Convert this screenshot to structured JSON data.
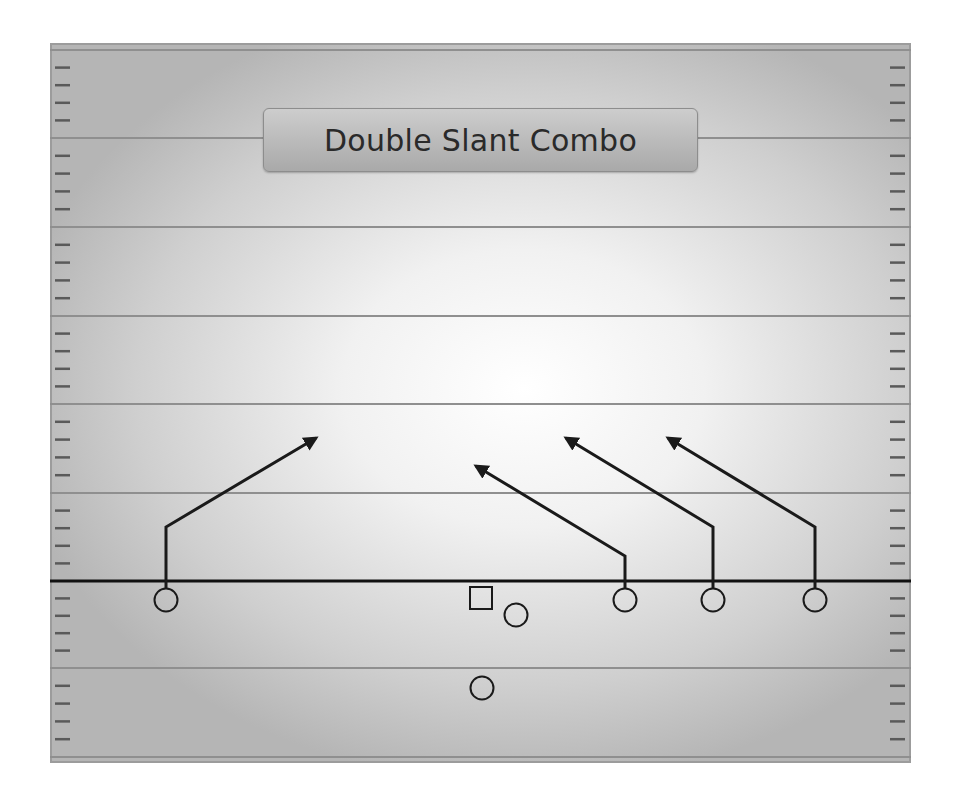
{
  "title": "Double Slant Combo",
  "colors": {
    "field_edge": "#b5b5b5",
    "field_center": "#ffffff",
    "yard_line": "#8f8f8f",
    "hash_mark": "#5a5a5a",
    "line_of_scrimmage": "#111111",
    "route": "#1a1a1a",
    "player_stroke": "#1a1a1a"
  },
  "field": {
    "x": 50,
    "y": 43,
    "width": 861,
    "height": 720,
    "yard_lines_y": [
      50,
      138,
      227,
      316,
      404,
      493,
      668,
      757
    ],
    "line_of_scrimmage_y": 581,
    "hash_spacing": 17.7
  },
  "players": [
    {
      "id": "wr-left",
      "shape": "circle",
      "x": 166,
      "y": 600
    },
    {
      "id": "center",
      "shape": "square",
      "x": 481,
      "y": 598
    },
    {
      "id": "qb",
      "shape": "circle",
      "x": 516,
      "y": 615
    },
    {
      "id": "slot-1",
      "shape": "circle",
      "x": 625,
      "y": 600
    },
    {
      "id": "slot-2",
      "shape": "circle",
      "x": 713,
      "y": 600
    },
    {
      "id": "wr-right",
      "shape": "circle",
      "x": 815,
      "y": 600
    },
    {
      "id": "running-back",
      "shape": "circle",
      "x": 482,
      "y": 688
    }
  ],
  "routes": [
    {
      "player": "wr-left",
      "type": "slant",
      "points": [
        [
          166,
          588
        ],
        [
          166,
          527
        ],
        [
          316,
          438
        ]
      ]
    },
    {
      "player": "slot-1",
      "type": "slant",
      "points": [
        [
          625,
          588
        ],
        [
          625,
          556
        ],
        [
          476,
          466
        ]
      ]
    },
    {
      "player": "slot-2",
      "type": "slant",
      "points": [
        [
          713,
          588
        ],
        [
          713,
          527
        ],
        [
          566,
          438
        ]
      ]
    },
    {
      "player": "wr-right",
      "type": "slant",
      "points": [
        [
          815,
          588
        ],
        [
          815,
          527
        ],
        [
          668,
          438
        ]
      ]
    }
  ]
}
